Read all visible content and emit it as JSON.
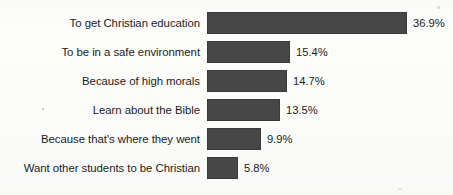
{
  "chart_data": {
    "type": "bar",
    "orientation": "horizontal",
    "title": "",
    "subtitle": "",
    "xlabel": "",
    "ylabel": "",
    "grid": false,
    "legend": null,
    "axis_visible": false,
    "xlim": [
      0,
      36.9
    ],
    "value_suffix": "%",
    "bar_color": "#474747",
    "text_color": "#1b1b1b",
    "background_color": "#fdfdfc",
    "categories": [
      "To get Christian education",
      "To be in a safe environment",
      "Because of high morals",
      "Learn about the Bible",
      "Because that's where they went",
      "Want other students to be Christian"
    ],
    "values": [
      36.9,
      15.4,
      14.7,
      13.5,
      9.9,
      5.8
    ],
    "value_labels": [
      "36.9%",
      "15.4%",
      "14.7%",
      "13.5%",
      "9.9%",
      "5.8%"
    ],
    "bars": [
      {
        "category": "To get Christian education",
        "value": 36.9,
        "label": "36.9%"
      },
      {
        "category": "To be in a safe environment",
        "value": 15.4,
        "label": "15.4%"
      },
      {
        "category": "Because of high morals",
        "value": 14.7,
        "label": "14.7%"
      },
      {
        "category": "Learn about the Bible",
        "value": 13.5,
        "label": "13.5%"
      },
      {
        "category": "Because that's where they went",
        "value": 9.9,
        "label": "9.9%"
      },
      {
        "category": "Want other students to be Christian",
        "value": 5.8,
        "label": "5.8%"
      }
    ]
  },
  "layout": {
    "bar_origin_x": 207,
    "px_per_unit": 5.42,
    "bar_height": 22,
    "row_pitch": 29,
    "first_row_top": 12,
    "label_gap": 6
  }
}
